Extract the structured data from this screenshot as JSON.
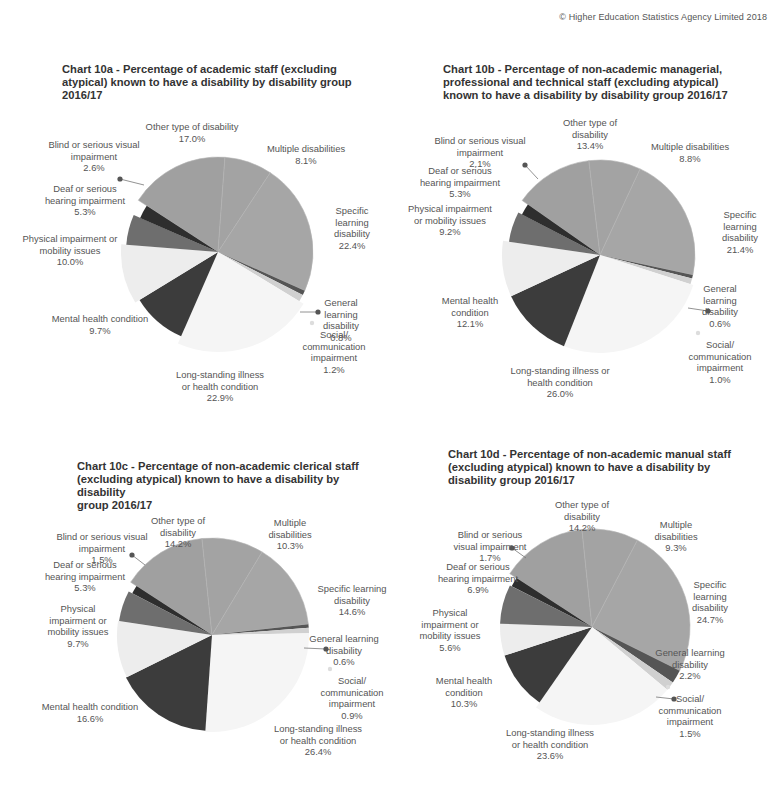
{
  "copyright": "© Higher Education Statistics Agency Limited 2018",
  "colors": {
    "other": "#a0a0a0",
    "multiple": "#a3a3a3",
    "specific": "#a6a6a6",
    "general": "#555555",
    "social": "#d0d0d0",
    "longstanding": "#f5f5f5",
    "mental": "#3c3c3c",
    "physical": "#ededed",
    "deaf": "#6e6e6e",
    "blind": "#2e2e2e",
    "leader_dot": "#555555",
    "text": "#555555",
    "title": "#333333"
  },
  "charts": {
    "a": {
      "title_lines": [
        "Chart 10a - Percentage of academic staff (excluding",
        "atypical) known to have a disability by disability group",
        "2016/17"
      ],
      "labels": {
        "other": [
          "Other type of disability",
          "17.0%"
        ],
        "multiple": [
          "Multiple disabilities",
          "8.1%"
        ],
        "specific": [
          "Specific",
          "learning",
          "disability",
          "22.4%"
        ],
        "general": [
          "General",
          "learning",
          "disability",
          "0.8%"
        ],
        "social": [
          "Social/",
          "communication",
          "impairment",
          "1.2%"
        ],
        "longstanding": [
          "Long-standing illness",
          "or health condition",
          "22.9%"
        ],
        "mental": [
          "Mental health condition",
          "9.7%"
        ],
        "physical": [
          "Physical impairment or",
          "mobility issues",
          "10.0%"
        ],
        "deaf": [
          "Deaf or serious",
          "hearing impairment",
          "5.3%"
        ],
        "blind": [
          "Blind or serious visual",
          "impairment",
          "2.6%"
        ]
      }
    },
    "b": {
      "title_lines": [
        "Chart 10b - Percentage of non-academic managerial,",
        "professional  and technical staff (excluding atypical)",
        "known to have a disability by disability group 2016/17"
      ],
      "labels": {
        "other": [
          "Other type of",
          "disability",
          "13.4%"
        ],
        "multiple": [
          "Multiple disabilities",
          "8.8%"
        ],
        "specific": [
          "Specific",
          "learning",
          "disability",
          "21.4%"
        ],
        "general": [
          "General",
          "learning",
          "disability",
          "0.6%"
        ],
        "social": [
          "Social/",
          "communication",
          "impairment",
          "1.0%"
        ],
        "longstanding": [
          "Long-standing illness or",
          "health condition",
          "26.0%"
        ],
        "mental": [
          "Mental health",
          "condition",
          "12.1%"
        ],
        "physical": [
          "Physical impairment",
          "or mobility issues",
          "9.2%"
        ],
        "deaf": [
          "Deaf or serious",
          "hearing impairment",
          "5.3%"
        ],
        "blind": [
          "Blind or serious visual",
          "impairment",
          "2.1%"
        ]
      }
    },
    "c": {
      "title_lines": [
        "Chart 10c - Percentage of non-academic clerical staff",
        "(excluding atypical) known to have a disability by disability",
        "group 2016/17"
      ],
      "labels": {
        "other": [
          "Other type of",
          "disability",
          "14.2%"
        ],
        "multiple": [
          "Multiple",
          "disabilities",
          "10.3%"
        ],
        "specific": [
          "Specific learning",
          "disability",
          "14.6%"
        ],
        "general": [
          "General learning",
          "disability",
          "0.6%"
        ],
        "social": [
          "Social/",
          "communication",
          "impairment",
          "0.9%"
        ],
        "longstanding": [
          "Long-standing illness",
          "or health condition",
          "26.4%"
        ],
        "mental": [
          "Mental health condition",
          "16.6%"
        ],
        "physical": [
          "Physical",
          "impairment or",
          "mobility issues",
          "9.7%"
        ],
        "deaf": [
          "Deaf or serious",
          "hearing impairment",
          "5.3%"
        ],
        "blind": [
          "Blind or serious visual",
          "impairment",
          "1.5%"
        ]
      }
    },
    "d": {
      "title_lines": [
        "Chart 10d - Percentage of non-academic manual staff",
        "(excluding atypical) known to have a disability by",
        "disability group 2016/17"
      ],
      "labels": {
        "other": [
          "Other type of",
          "disability",
          "14.2%"
        ],
        "multiple": [
          "Multiple",
          "disabilities",
          "9.3%"
        ],
        "specific": [
          "Specific",
          "learning",
          "disability",
          "24.7%"
        ],
        "general": [
          "General learning",
          "disability",
          "2.2%"
        ],
        "social": [
          "Social/",
          "communication",
          "impairment",
          "1.5%"
        ],
        "longstanding": [
          "Long-standing illness",
          "or health condition",
          "23.6%"
        ],
        "mental": [
          "Mental health",
          "condition",
          "10.3%"
        ],
        "physical": [
          "Physical",
          "impairment or",
          "mobility issues",
          "5.6%"
        ],
        "deaf": [
          "Deaf or serious",
          "hearing impairment",
          "6.9%"
        ],
        "blind": [
          "Blind or serious",
          "visual impairment",
          "1.7%"
        ]
      }
    }
  },
  "chart_data": [
    {
      "type": "pie",
      "title": "Chart 10a - Percentage of academic staff (excluding atypical) known to have a disability by disability group 2016/17",
      "categories": [
        "Other type of disability",
        "Multiple disabilities",
        "Specific learning disability",
        "General learning disability",
        "Social/communication impairment",
        "Long-standing illness or health condition",
        "Mental health condition",
        "Physical impairment or mobility issues",
        "Deaf or serious hearing impairment",
        "Blind or serious visual impairment"
      ],
      "values": [
        17.0,
        8.1,
        22.4,
        0.8,
        1.2,
        22.9,
        9.7,
        10.0,
        5.3,
        2.6
      ],
      "unit": "%"
    },
    {
      "type": "pie",
      "title": "Chart 10b - Percentage of non-academic managerial, professional and technical staff (excluding atypical) known to have a disability by disability group 2016/17",
      "categories": [
        "Other type of disability",
        "Multiple disabilities",
        "Specific learning disability",
        "General learning disability",
        "Social/communication impairment",
        "Long-standing illness or health condition",
        "Mental health condition",
        "Physical impairment or mobility issues",
        "Deaf or serious hearing impairment",
        "Blind or serious visual impairment"
      ],
      "values": [
        13.4,
        8.8,
        21.4,
        0.6,
        1.0,
        26.0,
        12.1,
        9.2,
        5.3,
        2.1
      ],
      "unit": "%"
    },
    {
      "type": "pie",
      "title": "Chart 10c - Percentage of non-academic clerical staff (excluding atypical) known to have a disability by disability group 2016/17",
      "categories": [
        "Other type of disability",
        "Multiple disabilities",
        "Specific learning disability",
        "General learning disability",
        "Social/communication impairment",
        "Long-standing illness or health condition",
        "Mental health condition",
        "Physical impairment or mobility issues",
        "Deaf or serious hearing impairment",
        "Blind or serious visual impairment"
      ],
      "values": [
        14.2,
        10.3,
        14.6,
        0.6,
        0.9,
        26.4,
        16.6,
        9.7,
        5.3,
        1.5
      ],
      "unit": "%"
    },
    {
      "type": "pie",
      "title": "Chart 10d - Percentage of non-academic manual staff (excluding atypical) known to have a disability by disability group 2016/17",
      "categories": [
        "Other type of disability",
        "Multiple disabilities",
        "Specific learning disability",
        "General learning disability",
        "Social/communication impairment",
        "Long-standing illness or health condition",
        "Mental health condition",
        "Physical impairment or mobility issues",
        "Deaf or serious hearing impairment",
        "Blind or serious visual impairment"
      ],
      "values": [
        14.2,
        9.3,
        24.7,
        2.2,
        1.5,
        23.6,
        10.3,
        5.6,
        6.9,
        1.7
      ],
      "unit": "%"
    }
  ]
}
